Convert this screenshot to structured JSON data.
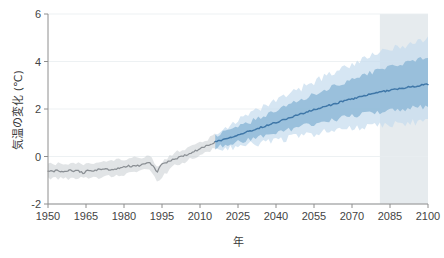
{
  "chart_data": {
    "type": "line",
    "title": "",
    "subtitle": "",
    "xlabel": "年",
    "ylabel": "気温の変化 (℃)",
    "xlim": [
      1950,
      2100
    ],
    "ylim": [
      -2,
      6
    ],
    "grid": true,
    "legend_position": "none",
    "xticks": [
      "1950",
      "1965",
      "1980",
      "1995",
      "2010",
      "2025",
      "2040",
      "2055",
      "2070",
      "2085",
      "2100"
    ],
    "xtick_values": [
      1950,
      1965,
      1980,
      1995,
      2010,
      2025,
      2040,
      2055,
      2070,
      2085,
      2100
    ],
    "yticks": [
      "6",
      "4",
      "2",
      "0",
      "-2"
    ],
    "ytick_values": [
      6,
      4,
      2,
      0,
      -2
    ],
    "annotations": [
      {
        "name": "highlight-band",
        "x_start": 2081,
        "x_end": 2100,
        "color": "#e6ebee",
        "label": ""
      }
    ],
    "colors": {
      "historical_line": "#8a8f94",
      "historical_band": "#c9ced2",
      "projection_line": "#3f77a8",
      "projection_band_inner": "#8bb6d6",
      "projection_band_outer": "#c4dcee",
      "highlight_band": "#e6ebee",
      "grid": "#e9edf0",
      "axis": "#8e8e8e",
      "text": "#444444",
      "background": "#ffffff"
    },
    "series": [
      {
        "name": "historical-median",
        "kind": "line",
        "color": "#8a8f94",
        "x": [
          1950,
          1952,
          1954,
          1956,
          1958,
          1960,
          1962,
          1964,
          1966,
          1968,
          1970,
          1972,
          1974,
          1976,
          1978,
          1980,
          1982,
          1984,
          1986,
          1988,
          1990,
          1992,
          1993,
          1994,
          1996,
          1998,
          2000,
          2002,
          2004,
          2006,
          2008,
          2010,
          2012,
          2014,
          2016
        ],
        "values": [
          -0.6,
          -0.62,
          -0.58,
          -0.66,
          -0.58,
          -0.62,
          -0.6,
          -0.7,
          -0.58,
          -0.6,
          -0.55,
          -0.52,
          -0.55,
          -0.58,
          -0.5,
          -0.42,
          -0.4,
          -0.42,
          -0.38,
          -0.3,
          -0.25,
          -0.5,
          -0.72,
          -0.4,
          -0.28,
          -0.18,
          -0.12,
          -0.02,
          0.05,
          0.14,
          0.22,
          0.32,
          0.42,
          0.52,
          0.62
        ]
      },
      {
        "name": "historical-spread-upper",
        "kind": "band-upper",
        "color": "#c9ced2",
        "x": [
          1950,
          1960,
          1970,
          1980,
          1990,
          1993,
          2000,
          2010,
          2016
        ],
        "values": [
          -0.3,
          -0.32,
          -0.25,
          -0.14,
          0.02,
          -0.4,
          0.14,
          0.58,
          0.9
        ]
      },
      {
        "name": "historical-spread-lower",
        "kind": "band-lower",
        "color": "#c9ced2",
        "x": [
          1950,
          1960,
          1970,
          1980,
          1990,
          1993,
          2000,
          2010,
          2016
        ],
        "values": [
          -0.92,
          -0.94,
          -0.88,
          -0.74,
          -0.56,
          -1.05,
          -0.4,
          0.06,
          0.32
        ]
      },
      {
        "name": "projection-median",
        "kind": "line",
        "color": "#3f77a8",
        "x": [
          2016,
          2020,
          2025,
          2030,
          2035,
          2040,
          2045,
          2050,
          2055,
          2060,
          2065,
          2070,
          2075,
          2080,
          2085,
          2090,
          2095,
          2100
        ],
        "values": [
          0.62,
          0.74,
          0.92,
          1.08,
          1.26,
          1.44,
          1.62,
          1.8,
          1.96,
          2.12,
          2.28,
          2.42,
          2.56,
          2.68,
          2.8,
          2.88,
          2.96,
          3.05
        ]
      },
      {
        "name": "projection-inner-upper",
        "kind": "band-upper",
        "color": "#8bb6d6",
        "x": [
          2016,
          2025,
          2035,
          2045,
          2055,
          2065,
          2075,
          2085,
          2095,
          2100
        ],
        "values": [
          0.86,
          1.24,
          1.7,
          2.16,
          2.62,
          3.05,
          3.45,
          3.8,
          4.05,
          4.15
        ]
      },
      {
        "name": "projection-inner-lower",
        "kind": "band-lower",
        "color": "#8bb6d6",
        "x": [
          2016,
          2025,
          2035,
          2045,
          2055,
          2065,
          2075,
          2085,
          2095,
          2100
        ],
        "values": [
          0.4,
          0.62,
          0.86,
          1.12,
          1.38,
          1.6,
          1.8,
          1.95,
          2.05,
          2.1
        ]
      },
      {
        "name": "projection-outer-upper",
        "kind": "band-upper",
        "color": "#c4dcee",
        "x": [
          2016,
          2025,
          2035,
          2045,
          2055,
          2065,
          2075,
          2085,
          2095,
          2100
        ],
        "values": [
          1.02,
          1.5,
          2.06,
          2.62,
          3.15,
          3.66,
          4.12,
          4.52,
          4.8,
          4.95
        ]
      },
      {
        "name": "projection-outer-lower",
        "kind": "band-lower",
        "color": "#c4dcee",
        "x": [
          2016,
          2025,
          2035,
          2045,
          2055,
          2065,
          2075,
          2085,
          2095,
          2100
        ],
        "values": [
          0.28,
          0.42,
          0.6,
          0.78,
          0.96,
          1.12,
          1.26,
          1.36,
          1.44,
          1.48
        ]
      }
    ]
  }
}
